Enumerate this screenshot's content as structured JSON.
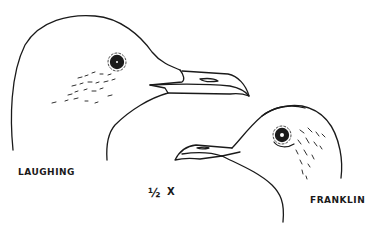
{
  "illustration": {
    "subject": "gull heads comparison",
    "line_color": "#1a1a1a",
    "background": "#ffffff"
  },
  "labels": {
    "laughing": "LAUGHING",
    "franklin": "FRANKLIN",
    "scale": "½",
    "scale_x": "X"
  }
}
